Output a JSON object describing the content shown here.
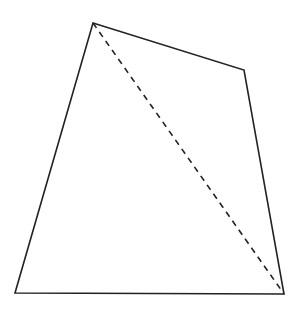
{
  "diagram": {
    "type": "quadrilateral-with-diagonal",
    "vertices": {
      "top": [
        93,
        23
      ],
      "right": [
        244,
        70
      ],
      "bottom_right": [
        284,
        294
      ],
      "bottom_left": [
        15,
        293
      ]
    },
    "diagonal": {
      "from": "top",
      "to": "bottom_right",
      "style": "dashed"
    },
    "colors": {
      "stroke": "#222222",
      "background": "#ffffff"
    }
  }
}
